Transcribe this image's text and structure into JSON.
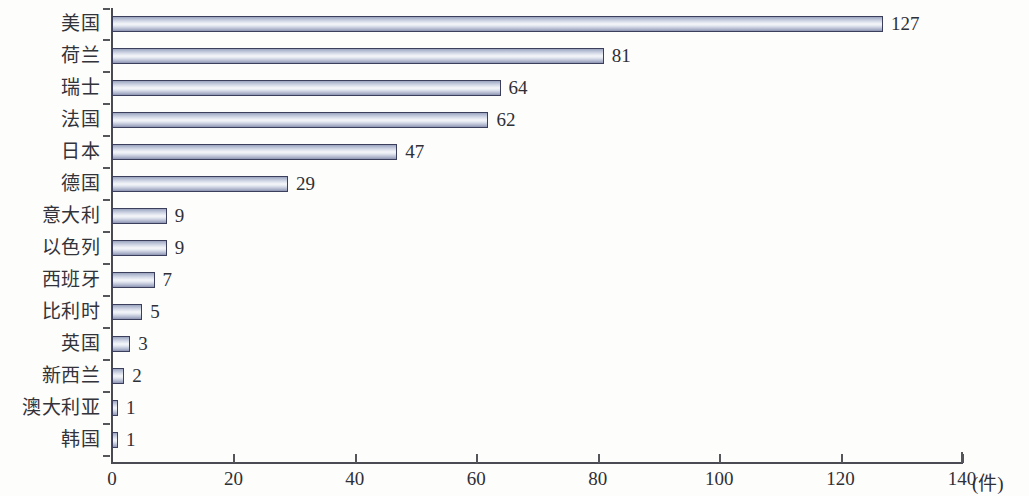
{
  "chart_data": {
    "type": "bar",
    "orientation": "horizontal",
    "title": "",
    "subtitle": "",
    "xlabel": "(件)",
    "ylabel": "",
    "categories": [
      "美国",
      "荷兰",
      "瑞士",
      "法国",
      "日本",
      "德国",
      "意大利",
      "以色列",
      "西班牙",
      "比利时",
      "英国",
      "新西兰",
      "澳大利亚",
      "韩国"
    ],
    "values": [
      127,
      81,
      64,
      62,
      47,
      29,
      9,
      9,
      7,
      5,
      3,
      2,
      1,
      1
    ],
    "data_labels": [
      "127",
      "81",
      "64",
      "62",
      "47",
      "29",
      "9",
      "9",
      "7",
      "5",
      "3",
      "2",
      "1",
      "1"
    ],
    "xlim": [
      0,
      140
    ],
    "x_ticks": [
      0,
      20,
      40,
      60,
      80,
      100,
      120,
      140
    ],
    "x_tick_labels": [
      "0",
      "20",
      "40",
      "60",
      "80",
      "100",
      "120",
      "140"
    ],
    "grid": false,
    "legend": false,
    "legend_position": "none",
    "unit_suffix": "(件)",
    "bar_border_color": "#3b3f5c",
    "bar_fill_light": "#f4f6fa",
    "bar_fill_dark": "#8d95b2",
    "axis_color": "#4a4a52",
    "text_color": "#2f2f36",
    "background_color": "#fdfdfc"
  }
}
